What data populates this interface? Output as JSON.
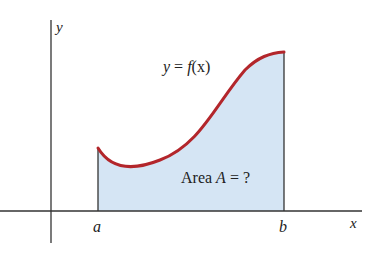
{
  "diagram": {
    "axes": {
      "x_label": "x",
      "y_label": "y"
    },
    "bounds": {
      "left_label": "a",
      "right_label": "b"
    },
    "curve": {
      "label_prefix": "y = ",
      "label_func": "f",
      "label_arg": "(x)"
    },
    "area": {
      "label_word": "Area ",
      "label_var": "A",
      "label_rest": " = ?"
    },
    "colors": {
      "fill": "#d5e5f4",
      "curve": "#b3262b",
      "axis": "#333333"
    }
  }
}
